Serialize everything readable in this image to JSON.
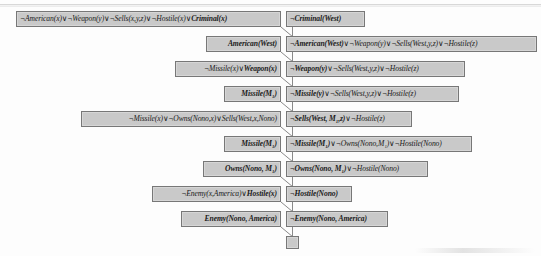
{
  "figure": {
    "type": "resolution-proof-tree",
    "box_fill": "#c9c9c9",
    "box_border": "#777777",
    "connector_color": "#8a8a8a",
    "rows": [
      {
        "index": 0,
        "left": "¬American(x)∨¬Weapon(y)∨¬Sells(x,y,z)∨¬Hostile(x)∨Criminal(x)",
        "left_bold_tail": "Criminal(x)",
        "right": "¬Criminal(West)"
      },
      {
        "index": 1,
        "left": "American(West)",
        "left_bold_tail": "American(West)",
        "right": "¬American(West)∨¬Weapon(y)∨¬Sells(West,y,z)∨¬Hostile(z)"
      },
      {
        "index": 2,
        "left": "¬Missile(x)∨Weapon(x)",
        "left_bold_tail": "Weapon(x)",
        "right": "¬Weapon(y)∨¬Sells(West,y,z)∨¬Hostile(z)"
      },
      {
        "index": 3,
        "left": "Missile(M₁)",
        "left_bold_tail": "Missile(M₁)",
        "right": "¬Missile(y)∨¬Sells(West,y,z)∨¬Hostile(z)"
      },
      {
        "index": 4,
        "left": "¬Missile(x)∨¬Owns(Nono,x)∨Sells(West,x,Nono)",
        "left_bold_tail": "Sells(West, x, Nono)",
        "right": "¬Sells(West, M₁,z)∨¬Hostile(z)"
      },
      {
        "index": 5,
        "left": "Missile(M₁)",
        "left_bold_tail": "Missile(M₁)",
        "right": "¬Missile(M₁)∨¬Owns(Nono,M₁)∨¬Hostile(Nono)"
      },
      {
        "index": 6,
        "left": "Owns(Nono, M₁)",
        "left_bold_tail": "Owns(Nono, M₁)",
        "right": "¬Owns(Nono, M₁)∨¬Hostile(Nono)"
      },
      {
        "index": 7,
        "left": "¬Enemy(x,America)∨Hostile(x)",
        "left_bold_tail": "Hostile(x)",
        "right": "¬Hostile(Nono)"
      },
      {
        "index": 8,
        "left": "Enemy(Nono, America)",
        "left_bold_tail": "Enemy(Nono, America)",
        "right": "¬Enemy(Nono, America)"
      }
    ],
    "empty_clause_label": ""
  }
}
